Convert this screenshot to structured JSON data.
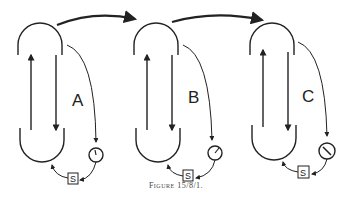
{
  "figure": {
    "caption": "Figure 15/8/1.",
    "units": [
      {
        "label": "A",
        "gauge_label": "S",
        "needle_angle": 160
      },
      {
        "label": "B",
        "gauge_label": "S",
        "needle_angle": 30
      },
      {
        "label": "C",
        "gauge_label": "S",
        "needle_angle": -45
      }
    ],
    "colors": {
      "line": "#222222",
      "background": "#ffffff"
    }
  }
}
